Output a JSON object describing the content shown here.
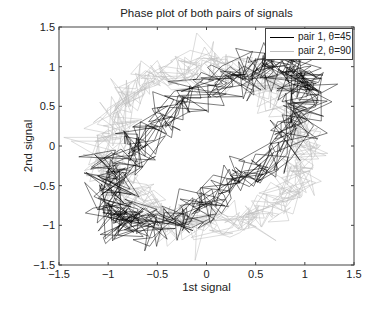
{
  "chart_data": {
    "type": "line",
    "title": "Phase plot of both pairs of signals",
    "xlabel": "1st signal",
    "ylabel": "2nd signal",
    "xlim": [
      -1.5,
      1.5
    ],
    "ylim": [
      -1.5,
      1.5
    ],
    "xticks": [
      -1.5,
      -1,
      -0.5,
      0,
      0.5,
      1,
      1.5
    ],
    "yticks": [
      -1.5,
      -1,
      -0.5,
      0,
      0.5,
      1,
      1.5
    ],
    "xtick_labels": [
      "−1.5",
      "−1",
      "−0.5",
      "0",
      "0.5",
      "1",
      "1.5"
    ],
    "ytick_labels": [
      "−1.5",
      "−1",
      "−0.5",
      "0",
      "0.5",
      "1",
      "1.5"
    ],
    "grid": false,
    "legend_position": "upper right",
    "series": [
      {
        "name": "pair 1, θ=45",
        "color": "#000000",
        "phase_deg": 45,
        "amplitude": 1.0,
        "noise": 0.13,
        "points": 700
      },
      {
        "name": "pair 2, θ=90",
        "color": "#bdbdbd",
        "phase_deg": 90,
        "amplitude": 1.0,
        "noise": 0.13,
        "points": 700
      }
    ]
  },
  "legend": {
    "items": [
      {
        "label": "pair 1, θ=45",
        "color": "#000000"
      },
      {
        "label": "pair 2, θ=90",
        "color": "#bdbdbd"
      }
    ]
  }
}
